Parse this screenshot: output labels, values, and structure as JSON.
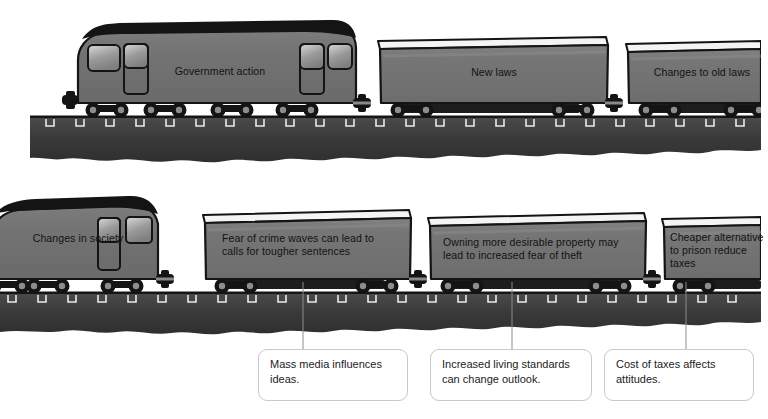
{
  "diagram": {
    "background_color": "#ffffff",
    "ink_color": "#141414",
    "body_gray": "#737373",
    "body_gray_dark": "#5f5f5f",
    "roof_white": "#f2f2f2",
    "ballast_color": "#3a3a3a",
    "callout_border": "#c9c9c9",
    "leader_color": "#8d8d8d"
  },
  "trains": [
    {
      "id": "train-top",
      "name": "government-action-train",
      "locomotive": {
        "name": "locomotive-government-action",
        "label": "Government action",
        "facing": "left"
      },
      "wagons": [
        {
          "name": "wagon-new-laws",
          "label": "New laws"
        },
        {
          "name": "wagon-changes-to-old-laws",
          "label": "Changes to old laws"
        }
      ]
    },
    {
      "id": "train-bottom",
      "name": "changes-in-society-train",
      "locomotive": {
        "name": "locomotive-changes-in-society",
        "label": "Changes in society",
        "facing": "right"
      },
      "wagons": [
        {
          "name": "wagon-fear-of-crime",
          "label": "Fear of crime waves can lead to\ncalls for tougher sentences"
        },
        {
          "name": "wagon-desirable-property",
          "label": "Owning more desirable property may\nlead to increased fear of theft"
        },
        {
          "name": "wagon-cheaper-alternative",
          "label": "Cheaper alternative\nto prison reduce\ntaxes"
        }
      ]
    }
  ],
  "callouts": [
    {
      "name": "callout-mass-media",
      "text": "Mass media influences\nideas."
    },
    {
      "name": "callout-living-standards",
      "text": "Increased living standards\ncan change outlook."
    },
    {
      "name": "callout-cost-of-taxes",
      "text": "Cost of taxes affects\nattitudes."
    }
  ]
}
